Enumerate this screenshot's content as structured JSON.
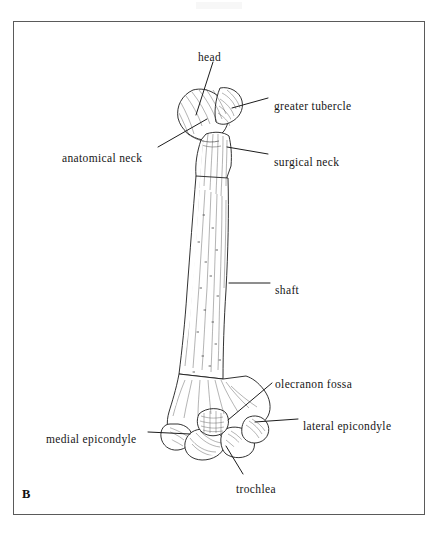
{
  "figure": {
    "panel_letter": "B",
    "view": "posterior",
    "frame_color": "#5a5a5a",
    "background_color": "#ffffff",
    "ink_color": "#161616"
  },
  "labels": [
    {
      "id": "head",
      "text": "head",
      "x": 198,
      "y": 52,
      "anchor": "start"
    },
    {
      "id": "greater-tubercle",
      "text": "greater tubercle",
      "x": 274,
      "y": 101,
      "anchor": "start"
    },
    {
      "id": "anatomical-neck",
      "text": "anatomical neck",
      "x": 62,
      "y": 153,
      "anchor": "start"
    },
    {
      "id": "surgical-neck",
      "text": "surgical neck",
      "x": 274,
      "y": 157,
      "anchor": "start"
    },
    {
      "id": "shaft",
      "text": "shaft",
      "x": 275,
      "y": 285,
      "anchor": "start"
    },
    {
      "id": "olecranon-fossa",
      "text": "olecranon fossa",
      "x": 275,
      "y": 379,
      "anchor": "start"
    },
    {
      "id": "lateral-epicondyle",
      "text": "lateral epicondyle",
      "x": 303,
      "y": 421,
      "anchor": "start"
    },
    {
      "id": "medial-epicondyle",
      "text": "medial epicondyle",
      "x": 46,
      "y": 434,
      "anchor": "start"
    },
    {
      "id": "trochlea",
      "text": "trochlea",
      "x": 236,
      "y": 484,
      "anchor": "start"
    }
  ],
  "leaders": [
    {
      "id": "leader-head",
      "x1": 213,
      "y1": 62,
      "x2": 196,
      "y2": 115
    },
    {
      "id": "leader-greater-tubercle",
      "x1": 268,
      "y1": 98,
      "x2": 232,
      "y2": 108
    },
    {
      "id": "leader-anatomical-neck",
      "x1": 158,
      "y1": 147,
      "x2": 207,
      "y2": 119
    },
    {
      "id": "leader-surgical-neck",
      "x1": 268,
      "y1": 154,
      "x2": 227,
      "y2": 147
    },
    {
      "id": "leader-shaft",
      "x1": 270,
      "y1": 283,
      "x2": 229,
      "y2": 283
    },
    {
      "id": "leader-olecranon-fossa",
      "x1": 272,
      "y1": 383,
      "x2": 228,
      "y2": 420
    },
    {
      "id": "leader-lateral-epicondyle",
      "x1": 298,
      "y1": 419,
      "x2": 255,
      "y2": 422
    },
    {
      "id": "leader-medial-epicondyle",
      "x1": 148,
      "y1": 432,
      "x2": 190,
      "y2": 434
    },
    {
      "id": "leader-trochlea",
      "x1": 243,
      "y1": 474,
      "x2": 226,
      "y2": 446
    }
  ]
}
